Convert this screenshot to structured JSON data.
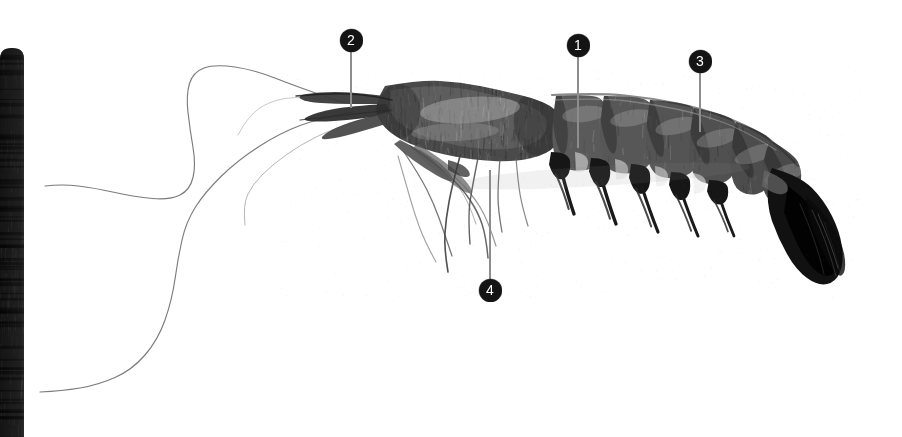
{
  "figure": {
    "width": 902,
    "height": 437,
    "background_color": "#ffffff",
    "alt": "Grayscale lateral view photograph of a shrimp specimen with four numbered anatomical callout markers"
  },
  "scale_bar": {
    "name": "black-ruler-strip",
    "color": "#141414",
    "x": 0,
    "y": 48,
    "width": 24,
    "height": 389
  },
  "callouts": [
    {
      "id": "callout-2",
      "label": "2",
      "badge_x": 351,
      "badge_y": 40,
      "line_x": 351,
      "line_top": 52,
      "line_bottom": 108,
      "direction": "down"
    },
    {
      "id": "callout-1",
      "label": "1",
      "badge_x": 578,
      "badge_y": 45,
      "line_x": 578,
      "line_top": 57,
      "line_bottom": 148,
      "direction": "down"
    },
    {
      "id": "callout-3",
      "label": "3",
      "badge_x": 700,
      "badge_y": 61,
      "line_x": 700,
      "line_top": 73,
      "line_bottom": 132,
      "direction": "down"
    },
    {
      "id": "callout-4",
      "label": "4",
      "badge_x": 490,
      "badge_y": 290,
      "line_x": 490,
      "line_top": 170,
      "line_bottom": 279,
      "direction": "up"
    }
  ],
  "colors": {
    "badge_fill": "#141414",
    "badge_text": "#ffffff",
    "leader_line": "#8d8d8d",
    "specimen_dark": "#1b1b1b",
    "specimen_mid": "#6f6f6f",
    "specimen_light": "#b8b8b8"
  }
}
